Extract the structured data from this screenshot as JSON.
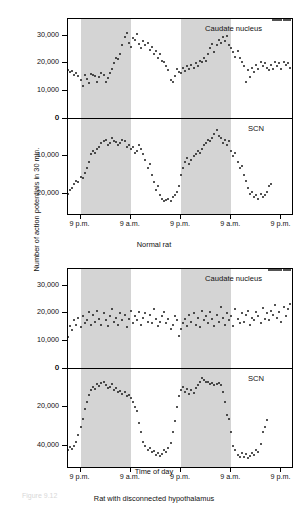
{
  "axis": {
    "y_title": "Number of action potentials in 30 min.",
    "x_title": "Time of day"
  },
  "figure_caption": "Figure 9.12",
  "charts": [
    {
      "caption": "Normal rat",
      "panels": [
        {
          "label": "Caudate nucleus",
          "yticks": [
            "0",
            "10,000",
            "20,000",
            "30,000"
          ]
        },
        {
          "label": "SCN",
          "yticks": [
            "0",
            "10,000",
            "20,000"
          ]
        }
      ],
      "xticks": [
        "9 p.m.",
        "9 a.m.",
        "9 p.m.",
        "9 a.m.",
        "9 p.m."
      ]
    },
    {
      "caption": "Rat with disconnected hypothalamus",
      "panels": [
        {
          "label": "Caudate nucleus",
          "yticks": [
            "0",
            "10,000",
            "20,000",
            "30,000"
          ]
        },
        {
          "label": "SCN",
          "yticks": [
            "0",
            "20,000",
            "40,000"
          ]
        }
      ],
      "xticks": [
        "9 p.m.",
        "9 a.m.",
        "9 p.m.",
        "9 a.m.",
        "9 p.m."
      ]
    }
  ],
  "chart_data": [
    {
      "type": "scatter",
      "title": "Normal rat",
      "subtitle": "Caudate nucleus",
      "xlabel": "Time of day",
      "ylabel": "Number of action potentials in 30 min.",
      "xtick_labels": [
        "9 p.m.",
        "9 a.m.",
        "9 p.m.",
        "9 a.m.",
        "9 p.m."
      ],
      "xtick_hours": [
        3,
        15,
        27,
        39,
        51
      ],
      "xlim": [
        0,
        54
      ],
      "ylim": [
        0,
        36000
      ],
      "ytick_values": [
        0,
        10000,
        20000,
        30000
      ],
      "grid": false,
      "dark_bands_hours": [
        [
          3,
          15
        ],
        [
          27,
          39
        ]
      ],
      "x": [
        0,
        0.5,
        1,
        1.5,
        2,
        2.5,
        3,
        3.5,
        4,
        4.5,
        5,
        5.5,
        6,
        6.5,
        7,
        7.5,
        8,
        8.5,
        9,
        9.5,
        10,
        10.5,
        11,
        11.5,
        12,
        12.5,
        13,
        13.5,
        14,
        14.5,
        15,
        15.5,
        16,
        16.5,
        17,
        17.5,
        18,
        18.5,
        19,
        19.5,
        20,
        20.5,
        21,
        21.5,
        22,
        22.5,
        23,
        23.5,
        24,
        24.5,
        25,
        25.5,
        26,
        26.5,
        27,
        27.5,
        28,
        28.5,
        29,
        29.5,
        30,
        30.5,
        31,
        31.5,
        32,
        32.5,
        33,
        33.5,
        34,
        34.5,
        35,
        35.5,
        36,
        36.5,
        37,
        37.5,
        38,
        38.5,
        39,
        39.5,
        40,
        40.5,
        41,
        41.5,
        42,
        42.5,
        43,
        43.5,
        44,
        44.5,
        45,
        45.5,
        46,
        46.5,
        47,
        47.5,
        48,
        48.5,
        49,
        49.5,
        50,
        50.5,
        51,
        51.5,
        52,
        52.5,
        53
      ],
      "y": [
        17500,
        16800,
        17200,
        16000,
        16500,
        15500,
        14200,
        12000,
        15800,
        14500,
        13000,
        16200,
        15800,
        15500,
        13500,
        15000,
        16500,
        15800,
        13200,
        14800,
        16500,
        18000,
        20000,
        22000,
        21500,
        23500,
        26500,
        29500,
        31000,
        27500,
        26000,
        29000,
        28500,
        30500,
        27000,
        25500,
        28000,
        26500,
        27500,
        25000,
        26000,
        23500,
        24500,
        22000,
        23500,
        21000,
        20500,
        19000,
        17500,
        14000,
        13500,
        15500,
        18000,
        17000,
        16500,
        18500,
        17200,
        19000,
        18000,
        19500,
        18500,
        20000,
        19000,
        21000,
        20500,
        22000,
        21000,
        23500,
        25500,
        27000,
        24000,
        26500,
        28500,
        27500,
        29500,
        28000,
        30000,
        26500,
        25500,
        24000,
        22500,
        24500,
        22000,
        20500,
        19000,
        13500,
        17500,
        15000,
        18500,
        17000,
        19500,
        18000,
        20500,
        19000,
        20000,
        18500,
        17500,
        19500,
        18000,
        20500,
        19000,
        20000,
        18000,
        20500,
        19500,
        20000,
        18500
      ]
    },
    {
      "type": "scatter",
      "title": "Normal rat",
      "subtitle": "SCN",
      "xlabel": "Time of day",
      "ylabel": "Number of action potentials in 30 min.",
      "xtick_labels": [
        "9 p.m.",
        "9 a.m.",
        "9 p.m.",
        "9 a.m.",
        "9 p.m."
      ],
      "xtick_hours": [
        3,
        15,
        27,
        39,
        51
      ],
      "xlim": [
        0,
        54
      ],
      "ylim": [
        0,
        26000
      ],
      "ytick_values": [
        0,
        10000,
        20000
      ],
      "grid": false,
      "note": "y axis increases downward from the 0 midline",
      "dark_bands_hours": [
        [
          3,
          15
        ],
        [
          27,
          39
        ]
      ],
      "x": [
        0,
        0.5,
        1,
        1.5,
        2,
        2.5,
        3,
        3.5,
        4,
        4.5,
        5,
        5.5,
        6,
        6.5,
        7,
        7.5,
        8,
        8.5,
        9,
        9.5,
        10,
        10.5,
        11,
        11.5,
        12,
        12.5,
        13,
        13.5,
        14,
        14.5,
        15,
        15.5,
        16,
        16.5,
        17,
        17.5,
        18,
        18.5,
        19,
        19.5,
        20,
        20.5,
        21,
        21.5,
        22,
        22.5,
        23,
        23.5,
        24,
        24.5,
        25,
        25.5,
        26,
        26.5,
        27,
        27.5,
        28,
        28.5,
        29,
        29.5,
        30,
        30.5,
        31,
        31.5,
        32,
        32.5,
        33,
        33.5,
        34,
        34.5,
        35,
        35.5,
        36,
        36.5,
        37,
        37.5,
        38,
        38.5,
        39,
        39.5,
        40,
        40.5,
        41,
        41.5,
        42,
        42.5,
        43,
        43.5,
        44,
        44.5,
        45,
        45.5,
        46,
        46.5,
        47,
        47.5,
        48,
        48.5,
        49,
        49.5,
        50,
        50.5,
        51,
        51.5,
        52,
        52.5,
        53
      ],
      "y": [
        20000,
        19000,
        18500,
        17500,
        16500,
        16800,
        15500,
        15800,
        14500,
        13000,
        11500,
        9500,
        8500,
        9000,
        8000,
        7500,
        6500,
        6000,
        5500,
        7000,
        6500,
        5000,
        5800,
        6200,
        7000,
        6500,
        5500,
        6000,
        7500,
        7000,
        8000,
        7500,
        9000,
        8500,
        7000,
        8000,
        9500,
        11000,
        13000,
        12000,
        15000,
        17000,
        19000,
        18000,
        20500,
        21500,
        22000,
        21800,
        21500,
        22000,
        21000,
        20500,
        19500,
        18000,
        15000,
        13000,
        11500,
        10500,
        12000,
        11000,
        10000,
        9500,
        8500,
        9000,
        8000,
        7000,
        6500,
        5500,
        6000,
        5000,
        4000,
        3000,
        4500,
        5000,
        6500,
        5500,
        7000,
        6000,
        8500,
        10000,
        9000,
        11500,
        13000,
        12500,
        15000,
        16500,
        18500,
        20000,
        19500,
        21000,
        20500,
        21500,
        20000,
        21000,
        20500,
        19500,
        18000,
        17500
      ]
    },
    {
      "type": "scatter",
      "title": "Rat with disconnected hypothalamus",
      "subtitle": "Caudate nucleus",
      "xlabel": "Time of day",
      "ylabel": "Number of action potentials in 30 min.",
      "xtick_labels": [
        "9 p.m.",
        "9 a.m.",
        "9 p.m.",
        "9 a.m.",
        "9 p.m."
      ],
      "xtick_hours": [
        3,
        15,
        27,
        39,
        51
      ],
      "xlim": [
        0,
        54
      ],
      "ylim": [
        0,
        36000
      ],
      "ytick_values": [
        0,
        10000,
        20000,
        30000
      ],
      "grid": false,
      "dark_bands_hours": [
        [
          3,
          15
        ],
        [
          27,
          39
        ]
      ],
      "x": [
        0,
        0.5,
        1,
        1.5,
        2,
        2.5,
        3,
        3.5,
        4,
        4.5,
        5,
        5.5,
        6,
        6.5,
        7,
        7.5,
        8,
        8.5,
        9,
        9.5,
        10,
        10.5,
        11,
        11.5,
        12,
        12.5,
        13,
        13.5,
        14,
        14.5,
        15,
        15.5,
        16,
        16.5,
        17,
        17.5,
        18,
        18.5,
        19,
        19.5,
        20,
        20.5,
        21,
        21.5,
        22,
        22.5,
        23,
        23.5,
        24,
        24.5,
        25,
        25.5,
        26,
        26.5,
        27,
        27.5,
        28,
        28.5,
        29,
        29.5,
        30,
        30.5,
        31,
        31.5,
        32,
        32.5,
        33,
        33.5,
        34,
        34.5,
        35,
        35.5,
        36,
        36.5,
        37,
        37.5,
        38,
        38.5,
        39,
        39.5,
        40,
        40.5,
        41,
        41.5,
        42,
        42.5,
        43,
        43.5,
        44,
        44.5,
        45,
        45.5,
        46,
        46.5,
        47,
        47.5,
        48,
        48.5,
        49,
        49.5,
        50,
        50.5,
        51,
        51.5,
        52,
        52.5,
        53
      ],
      "y": [
        11500,
        15500,
        14000,
        17500,
        16000,
        18500,
        15000,
        19000,
        16500,
        17500,
        20500,
        16000,
        19500,
        17000,
        21000,
        18000,
        16000,
        20000,
        17500,
        15500,
        19000,
        21500,
        17000,
        18500,
        16000,
        20000,
        17500,
        19500,
        15000,
        18000,
        21000,
        16500,
        19000,
        17500,
        20500,
        16000,
        18500,
        20000,
        17000,
        19500,
        16500,
        21500,
        18000,
        15500,
        17000,
        19000,
        20500,
        16500,
        18000,
        14500,
        16000,
        19000,
        17500,
        12000,
        14500,
        16500,
        18000,
        15500,
        19500,
        17000,
        20000,
        16000,
        18500,
        15000,
        21000,
        17500,
        19000,
        16500,
        20500,
        18000,
        15500,
        19500,
        17000,
        22500,
        18500,
        16000,
        20000,
        17500,
        19000,
        15500,
        21500,
        18000,
        16500,
        20000,
        17000,
        19500,
        21000,
        16000,
        18500,
        17500,
        20500,
        19000,
        16500,
        22000,
        18000,
        20000,
        17500,
        21000,
        19500,
        23000,
        18500,
        20500,
        17000,
        22500,
        19000,
        21500,
        23500
      ]
    },
    {
      "type": "scatter",
      "title": "Rat with disconnected hypothalamus",
      "subtitle": "SCN",
      "xlabel": "Time of day",
      "ylabel": "Number of action potentials in 30 min.",
      "xtick_labels": [
        "9 p.m.",
        "9 a.m.",
        "9 p.m.",
        "9 a.m.",
        "9 p.m."
      ],
      "xtick_hours": [
        3,
        15,
        27,
        39,
        51
      ],
      "xlim": [
        0,
        54
      ],
      "ylim": [
        0,
        52000
      ],
      "ytick_values": [
        0,
        20000,
        40000
      ],
      "grid": false,
      "note": "y axis increases downward from the 0 midline",
      "dark_bands_hours": [
        [
          3,
          15
        ],
        [
          27,
          39
        ]
      ],
      "x": [
        0,
        0.5,
        1,
        1.5,
        2,
        2.5,
        3,
        3.5,
        4,
        4.5,
        5,
        5.5,
        6,
        6.5,
        7,
        7.5,
        8,
        8.5,
        9,
        9.5,
        10,
        10.5,
        11,
        11.5,
        12,
        12.5,
        13,
        13.5,
        14,
        14.5,
        15,
        15.5,
        16,
        16.5,
        17,
        17.5,
        18,
        18.5,
        19,
        19.5,
        20,
        20.5,
        21,
        21.5,
        22,
        22.5,
        23,
        23.5,
        24,
        24.5,
        25,
        25.5,
        26,
        26.5,
        27,
        27.5,
        28,
        28.5,
        29,
        29.5,
        30,
        30.5,
        31,
        31.5,
        32,
        32.5,
        33,
        33.5,
        34,
        34.5,
        35,
        35.5,
        36,
        36.5,
        37,
        37.5,
        38,
        38.5,
        39,
        39.5,
        40,
        40.5,
        41,
        41.5,
        42,
        42.5,
        43,
        43.5,
        44,
        44.5,
        45,
        45.5,
        46,
        46.5,
        47,
        47.5,
        48,
        48.5,
        49,
        49.5,
        50,
        50.5,
        51,
        51.5,
        52,
        52.5,
        53
      ],
      "y": [
        42000,
        40500,
        41500,
        40000,
        38000,
        34500,
        30000,
        26000,
        21000,
        17000,
        13500,
        11000,
        9500,
        10500,
        8000,
        9000,
        7500,
        6500,
        8500,
        10000,
        9500,
        8000,
        11000,
        10000,
        12000,
        11500,
        13000,
        12000,
        14000,
        13500,
        15000,
        17000,
        19500,
        22000,
        28000,
        33000,
        38000,
        40000,
        42000,
        41000,
        43000,
        42500,
        44500,
        43500,
        45000,
        44000,
        42000,
        43000,
        41000,
        38500,
        33000,
        27000,
        20000,
        14000,
        11000,
        9500,
        12000,
        10500,
        13000,
        11000,
        12500,
        10000,
        8500,
        6500,
        4500,
        5500,
        7000,
        6500,
        8000,
        7500,
        8500,
        8000,
        7500,
        8500,
        12000,
        17000,
        24000,
        26000,
        33000,
        40000,
        42000,
        44500,
        46000,
        43500,
        45500,
        44000,
        46500,
        45000,
        43500,
        44500,
        42000,
        43000,
        39000,
        33000,
        30000,
        26500
      ]
    }
  ]
}
